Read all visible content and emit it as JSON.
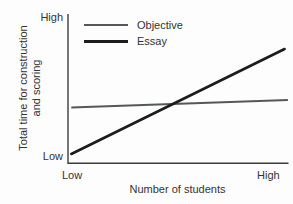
{
  "chart_data": {
    "type": "line",
    "title": "",
    "xlabel": "Number of students",
    "ylabel": "Total time for construction and scoring",
    "ylabel_lines": [
      "Total time for construction",
      "and scoring"
    ],
    "x_tick_labels": [
      "Low",
      "High"
    ],
    "y_tick_labels": [
      "Low",
      "High"
    ],
    "x_range": [
      0,
      1
    ],
    "y_range": [
      0,
      1
    ],
    "grid": false,
    "legend_position": "inside-top-left",
    "axis_color": "#3c3c3c",
    "text_color": "#333333",
    "series": [
      {
        "name": "Objective",
        "color": "#55585b",
        "width": 2,
        "x": [
          0.015,
          0.995
        ],
        "y": [
          0.37,
          0.42
        ]
      },
      {
        "name": "Essay",
        "color": "#1c1c1c",
        "width": 2.6,
        "x": [
          0.015,
          0.98
        ],
        "y": [
          0.06,
          0.76
        ]
      }
    ]
  }
}
